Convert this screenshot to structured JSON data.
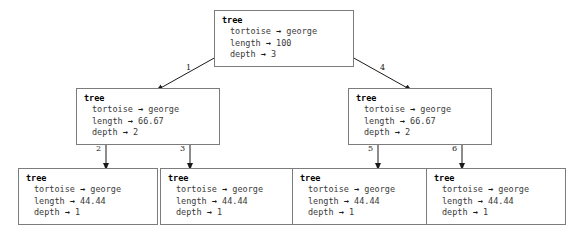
{
  "diagram": {
    "type": "tree",
    "node_label_key": "tree",
    "arrow_glyph": "→",
    "colors": {
      "background": "#ffffff",
      "node_border": "#7c7c7c",
      "node_fill": "#ffffff",
      "edge": "#1a1a1a",
      "title_text": "#000000",
      "body_text": "#3a3a3a",
      "label_text": "#222222"
    },
    "nodes": [
      {
        "id": "root",
        "title": "tree",
        "rows": [
          {
            "key": "tortoise",
            "value": "george"
          },
          {
            "key": "length",
            "value": "100"
          },
          {
            "key": "depth",
            "value": "3"
          }
        ]
      },
      {
        "id": "mid-left",
        "title": "tree",
        "rows": [
          {
            "key": "tortoise",
            "value": "george"
          },
          {
            "key": "length",
            "value": "66.67"
          },
          {
            "key": "depth",
            "value": "2"
          }
        ]
      },
      {
        "id": "mid-right",
        "title": "tree",
        "rows": [
          {
            "key": "tortoise",
            "value": "george"
          },
          {
            "key": "length",
            "value": "66.67"
          },
          {
            "key": "depth",
            "value": "2"
          }
        ]
      },
      {
        "id": "leaf-1",
        "title": "tree",
        "rows": [
          {
            "key": "tortoise",
            "value": "george"
          },
          {
            "key": "length",
            "value": "44.44"
          },
          {
            "key": "depth",
            "value": "1"
          }
        ]
      },
      {
        "id": "leaf-2",
        "title": "tree",
        "rows": [
          {
            "key": "tortoise",
            "value": "george"
          },
          {
            "key": "length",
            "value": "44.44"
          },
          {
            "key": "depth",
            "value": "1"
          }
        ]
      },
      {
        "id": "leaf-3",
        "title": "tree",
        "rows": [
          {
            "key": "tortoise",
            "value": "george"
          },
          {
            "key": "length",
            "value": "44.44"
          },
          {
            "key": "depth",
            "value": "1"
          }
        ]
      },
      {
        "id": "leaf-4",
        "title": "tree",
        "rows": [
          {
            "key": "tortoise",
            "value": "george"
          },
          {
            "key": "length",
            "value": "44.44"
          },
          {
            "key": "depth",
            "value": "1"
          }
        ]
      }
    ],
    "edges": [
      {
        "id": "e1",
        "label": "1",
        "from": "root",
        "to": "mid-left"
      },
      {
        "id": "e4",
        "label": "4",
        "from": "root",
        "to": "mid-right"
      },
      {
        "id": "e2",
        "label": "2",
        "from": "mid-left",
        "to": "leaf-1"
      },
      {
        "id": "e3",
        "label": "3",
        "from": "mid-left",
        "to": "leaf-2"
      },
      {
        "id": "e5",
        "label": "5",
        "from": "mid-right",
        "to": "leaf-3"
      },
      {
        "id": "e6",
        "label": "6",
        "from": "mid-right",
        "to": "leaf-4"
      }
    ]
  }
}
